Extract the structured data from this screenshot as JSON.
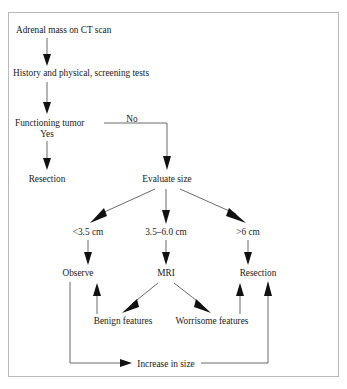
{
  "figure": {
    "type": "clinical-decision-flowchart",
    "border_color": "#b9b9b9",
    "background_color": "#ffffff",
    "text_color": "#1a1a1a",
    "connector_color": "#5a5a5a"
  },
  "nodes": {
    "adrenal_mass": "Adrenal mass on CT scan",
    "history_physical": "History and physical, screening tests",
    "functioning_tumor": "Functioning tumor",
    "resection_top": "Resection",
    "evaluate_size": "Evaluate size",
    "size_small": "<3.5 cm",
    "size_medium": "3.5–6.0 cm",
    "size_large": ">6 cm",
    "observe": "Observe",
    "mri": "MRI",
    "resection_bottom": "Resection",
    "benign_features": "Benign features",
    "worrisome_features": "Worrisome features",
    "increase_in_size": "Increase in size"
  },
  "edge_labels": {
    "yes": "Yes",
    "no": "No"
  }
}
